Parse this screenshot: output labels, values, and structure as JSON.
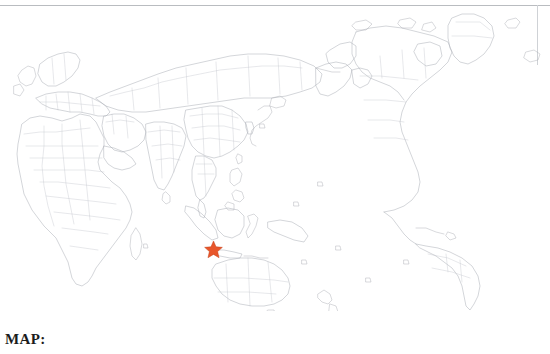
{
  "figure": {
    "caption": "MAP:",
    "alt_name": "world-map-asia-pacific-centered"
  },
  "map": {
    "projection": "equirectangular",
    "center_region": "Asia-Pacific",
    "background_color": "#ffffff",
    "coastline_color": "#a9adb4",
    "border_color": "#c2c6cc",
    "rule_color": "#b9bcc0",
    "lon_min": -5,
    "lon_max": 320,
    "lat_min": -58,
    "lat_max": 84,
    "visible_landmasses": [
      "Africa",
      "Europe",
      "Middle East",
      "Russia",
      "India",
      "China",
      "Japan",
      "Southeast Asia",
      "Indonesia",
      "Australia",
      "New Zealand",
      "Greenland",
      "Canada",
      "Alaska",
      "North America",
      "South America"
    ]
  },
  "marker": {
    "name": "location-star",
    "shape": "star",
    "points": 5,
    "fill_color": "#e8562b",
    "stroke_color": "#c43f18",
    "label": "",
    "approx_region": "Java / Sunda Strait, Indonesia",
    "x_px": 213,
    "y_px": 249
  }
}
